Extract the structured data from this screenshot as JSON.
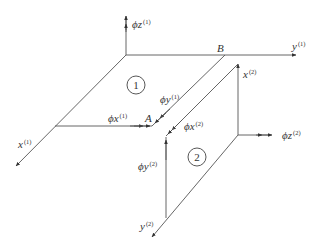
{
  "diagram": {
    "element1": {
      "label": "1",
      "axes": {
        "x": {
          "base": "x",
          "sup": "(1)"
        },
        "y": {
          "base": "y",
          "sup": "(1)"
        }
      },
      "rotations": {
        "phi_z": {
          "base": "ϕz",
          "sup": "(1)"
        },
        "phi_x": {
          "base": "ϕx",
          "sup": "(1)"
        },
        "phi_y": {
          "base": "ϕy",
          "sup": "(1)"
        }
      }
    },
    "element2": {
      "label": "2",
      "axes": {
        "x": {
          "base": "x",
          "sup": "(2)"
        },
        "y": {
          "base": "y",
          "sup": "(2)"
        }
      },
      "rotations": {
        "phi_z": {
          "base": "ϕz",
          "sup": "(2)"
        },
        "phi_x": {
          "base": "ϕx",
          "sup": "(2)"
        },
        "phi_y": {
          "base": "ϕy",
          "sup": "(2)"
        }
      }
    },
    "points": {
      "A": "A",
      "B": "B"
    },
    "colors": {
      "line": "#555555",
      "text": "#333333",
      "background": "#ffffff"
    }
  }
}
